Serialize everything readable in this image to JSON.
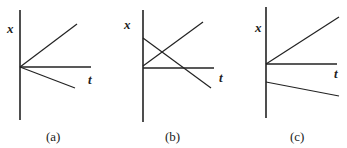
{
  "figure": {
    "panels": [
      {
        "id": "a",
        "caption": "(a)",
        "y_axis_label": "x",
        "x_axis_label": "t",
        "axes": {
          "y_axis": {
            "x": 20,
            "y1": 10,
            "y2": 120
          },
          "x_axis": {
            "y": 67,
            "x1": 20,
            "x2": 91
          }
        },
        "lines": [
          {
            "name": "rising-line",
            "x1": 20,
            "y1": 67,
            "x2": 77,
            "y2": 24
          },
          {
            "name": "falling-line",
            "x1": 20,
            "y1": 67,
            "x2": 75,
            "y2": 88
          }
        ],
        "labels": {
          "y": {
            "x": 7,
            "y": 33
          },
          "t": {
            "x": 88,
            "y": 84
          },
          "caption": {
            "x": 46,
            "y": 141
          }
        }
      },
      {
        "id": "b",
        "caption": "(b)",
        "y_axis_label": "x",
        "x_axis_label": "t",
        "axes": {
          "y_axis": {
            "x": 143,
            "y1": 10,
            "y2": 122
          },
          "x_axis": {
            "y": 68,
            "x1": 143,
            "x2": 214
          }
        },
        "lines": [
          {
            "name": "rising-line",
            "x1": 143,
            "y1": 66,
            "x2": 203,
            "y2": 22
          },
          {
            "name": "falling-line",
            "x1": 143,
            "y1": 38,
            "x2": 211,
            "y2": 88
          }
        ],
        "labels": {
          "y": {
            "x": 124,
            "y": 29
          },
          "t": {
            "x": 219,
            "y": 82
          },
          "caption": {
            "x": 165,
            "y": 141
          }
        }
      },
      {
        "id": "c",
        "caption": "(c)",
        "y_axis_label": "x",
        "x_axis_label": "t",
        "axes": {
          "y_axis": {
            "x": 266,
            "y1": 7,
            "y2": 118
          },
          "x_axis": {
            "y": 64,
            "x1": 266,
            "x2": 337
          }
        },
        "lines": [
          {
            "name": "rising-line",
            "x1": 266,
            "y1": 64,
            "x2": 339,
            "y2": 17
          },
          {
            "name": "falling-line",
            "x1": 266,
            "y1": 82,
            "x2": 339,
            "y2": 96
          }
        ],
        "labels": {
          "y": {
            "x": 255,
            "y": 32
          },
          "t": {
            "x": 334,
            "y": 78
          },
          "caption": {
            "x": 290,
            "y": 141
          }
        }
      }
    ]
  }
}
